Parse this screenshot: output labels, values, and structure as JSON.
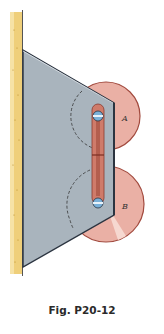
{
  "figure": {
    "caption": "Fig. P20-12",
    "labels": {
      "disk_a": "A",
      "disk_b": "B"
    },
    "colors": {
      "wall": "#e8c463",
      "plate": "#a9b4bd",
      "plate_edge": "#2b3440",
      "disk": "#e8a59a",
      "disk_rim": "#a24a3e",
      "link": "#cf7b6a",
      "pin": "#7ab0d8"
    },
    "components": [
      "wall",
      "plate",
      "disk-a",
      "disk-b",
      "slotted-link",
      "pin-a",
      "pin-b"
    ]
  }
}
